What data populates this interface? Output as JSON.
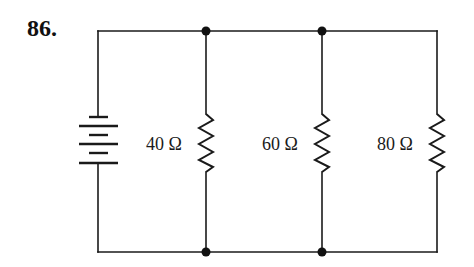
{
  "problem": {
    "number": "86."
  },
  "circuit": {
    "type": "parallel resistor circuit with battery",
    "source": {
      "type": "battery",
      "cells": 3
    },
    "resistors": [
      {
        "label": "40 Ω",
        "value_ohms": 40
      },
      {
        "label": "60 Ω",
        "value_ohms": 60
      },
      {
        "label": "80 Ω",
        "value_ohms": 80
      }
    ],
    "junctions": 4,
    "colors": {
      "wire": "#1a1a1a",
      "background": "#ffffff"
    }
  }
}
